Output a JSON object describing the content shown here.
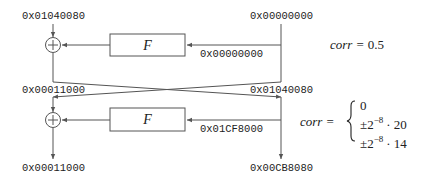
{
  "diagram": {
    "type": "feistel-differential-trail",
    "rounds": 2,
    "round1": {
      "input_left": "0x01040080",
      "input_right": "0x00000000",
      "f_label": "F",
      "f_output": "0x00000000",
      "corr": "corr = 0.5",
      "corr_name": "corr",
      "corr_value": "0.5"
    },
    "middle": {
      "left": "0x00011000",
      "right": "0x01040080"
    },
    "round2": {
      "f_label": "F",
      "f_output": "0x01CF8000",
      "corr_name": "corr",
      "corr_cases": [
        "0",
        "±2⁻⁸ · 20",
        "±2⁻⁸ · 14"
      ],
      "case_base": "±2",
      "case_exp": "−8",
      "case_mult": [
        "· 20",
        "· 14"
      ],
      "case_zero": "0"
    },
    "output": {
      "left": "0x00011000",
      "right": "0x00CB8080"
    },
    "symbols": {
      "xor": "xor-circle-plus",
      "equals": "="
    },
    "colors": {
      "line": "#555555",
      "text": "#222222",
      "background": "#ffffff"
    }
  }
}
